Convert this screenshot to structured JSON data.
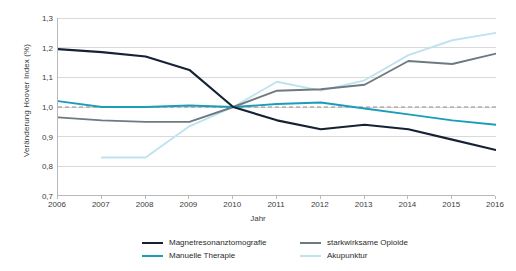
{
  "chart_data": {
    "type": "line",
    "title": "",
    "xlabel": "Jahr",
    "ylabel": "Veränderung Hoover Index (%)",
    "categories": [
      "2006",
      "2007",
      "2008",
      "2009",
      "2010",
      "2011",
      "2012",
      "2013",
      "2014",
      "2015",
      "2016"
    ],
    "x": [
      2006,
      2007,
      2008,
      2009,
      2010,
      2011,
      2012,
      2013,
      2014,
      2015,
      2016
    ],
    "xlim": [
      2006,
      2016
    ],
    "ylim": [
      0.7,
      1.3
    ],
    "ytick_labels": [
      "1,3",
      "1,2",
      "1,1",
      "1,0",
      "0,9",
      "0,8",
      "0,7"
    ],
    "ytick_values": [
      1.3,
      1.2,
      1.1,
      1.0,
      0.9,
      0.8,
      0.7
    ],
    "grid": "horizontal",
    "legend_position": "bottom",
    "reference_line": {
      "value": 1.0,
      "style": "dashed",
      "color": "#9a8c86"
    },
    "series": [
      {
        "name": "Magnetresonanztomografie",
        "color": "#152233",
        "values": [
          1.195,
          1.185,
          1.17,
          1.125,
          1.0,
          0.955,
          0.925,
          0.94,
          0.925,
          0.89,
          0.855
        ]
      },
      {
        "name": "Manuelle Therapie",
        "color": "#1b9cb8",
        "values": [
          1.02,
          1.0,
          1.0,
          1.005,
          1.0,
          1.01,
          1.015,
          0.995,
          0.975,
          0.955,
          0.94
        ]
      },
      {
        "name": "starkwirksame Opioide",
        "color": "#6e7a80",
        "values": [
          0.965,
          0.955,
          0.95,
          0.95,
          1.0,
          1.055,
          1.06,
          1.075,
          1.155,
          1.145,
          1.18
        ]
      },
      {
        "name": "Akupunktur",
        "color": "#bfe2f0",
        "values": [
          null,
          0.83,
          0.83,
          0.935,
          1.0,
          1.085,
          1.055,
          1.09,
          1.175,
          1.225,
          1.25
        ]
      }
    ]
  },
  "axes": {
    "y_title": "Veränderung Hoover Index (%)",
    "x_title": "Jahr"
  },
  "legend": {
    "items": [
      {
        "label": "Magnetresonanztomografie",
        "color": "#152233"
      },
      {
        "label": "Manuelle Therapie",
        "color": "#1b9cb8"
      },
      {
        "label": "starkwirksame Opioide",
        "color": "#6e7a80"
      },
      {
        "label": "Akupunktur",
        "color": "#bfe2f0"
      }
    ]
  }
}
